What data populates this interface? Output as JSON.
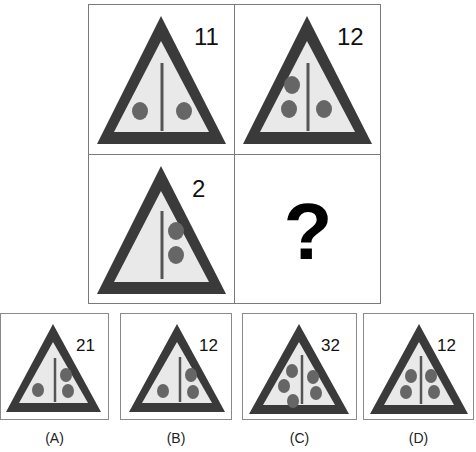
{
  "colors": {
    "triangle_border": "#3a3a3a",
    "triangle_fill": "#e9e9e9",
    "dot": "#666666",
    "divider": "#555555",
    "grid_line": "#7a7a7a",
    "number": "#111111"
  },
  "puzzle": {
    "cells": [
      {
        "position": "top-left",
        "number": "11",
        "left_dots": 1,
        "right_dots": 1
      },
      {
        "position": "top-right",
        "number": "12",
        "left_dots": 2,
        "right_dots": 1
      },
      {
        "position": "bottom-left",
        "number": "2",
        "left_dots": 0,
        "right_dots": 2
      },
      {
        "position": "bottom-right",
        "question_mark": "?"
      }
    ]
  },
  "options": [
    {
      "label": "(A)",
      "number": "21",
      "left_dots": 1,
      "right_dots": 2
    },
    {
      "label": "(B)",
      "number": "12",
      "left_dots": 1,
      "right_dots": 2
    },
    {
      "label": "(C)",
      "number": "32",
      "left_dots": 3,
      "right_dots": 2
    },
    {
      "label": "(D)",
      "number": "12",
      "left_dots": 2,
      "right_dots": 2
    }
  ]
}
